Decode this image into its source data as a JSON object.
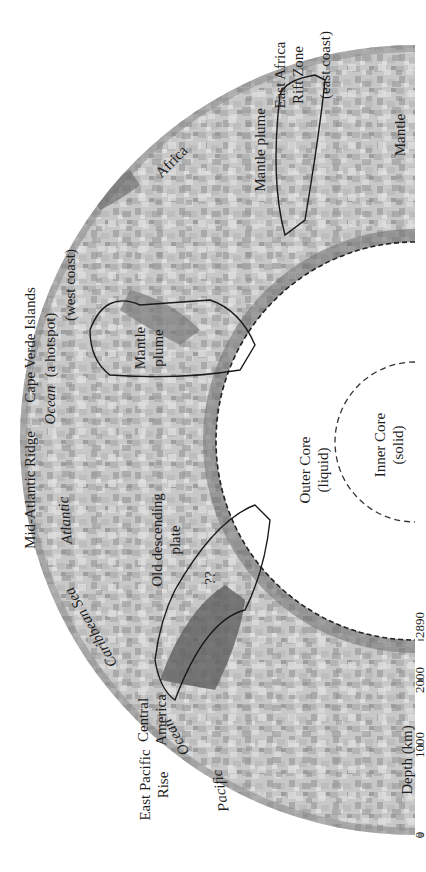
{
  "figure": {
    "type": "seismic tomography cross-section",
    "orientation": "rotated 90 degrees counter-clockwise",
    "regions": {
      "outer_core": {
        "label": "Outer Core",
        "sub": "(liquid)"
      },
      "inner_core": {
        "label": "Inner Core",
        "sub": "(solid)"
      },
      "mantle": {
        "label": "Mantle"
      }
    },
    "annotations": {
      "old_plate": {
        "line1": "Old descending",
        "line2": "plate",
        "question": "??"
      },
      "plume_atlantic": {
        "line1": "Mantle",
        "line2": "plume"
      },
      "plume_africa": {
        "label": "Mantle plume"
      }
    },
    "surface_labels": {
      "east_pacific": {
        "line1": "East Pacific",
        "line2": "Rise"
      },
      "pacific": "Pacific",
      "ocean_pacific": "Ocean",
      "central_america": {
        "line1": "Central",
        "line2": "America"
      },
      "caribbean": "Caribbean Sea",
      "atlantic": "Atlantic",
      "mid_atlantic": "Mid-Atlantic Ridge",
      "ocean_atlantic": "Ocean",
      "cape_verde": {
        "line1": "Cape Verde Islands",
        "line2": "(a hotspot)"
      },
      "west_coast": "(west coast)",
      "africa": "Africa",
      "east_africa": {
        "line1": "East Africa",
        "line2": "Rift Zone"
      },
      "east_coast": "(east coast)"
    },
    "depth_axis": {
      "title": "Depth (km)",
      "ticks": [
        "0",
        "1000",
        "2000",
        "2890"
      ]
    },
    "colors": {
      "fast_dark": "#6a6a6a",
      "mid": "#a8a8a8",
      "slow_light": "#d4d4d4",
      "outline": "#1a1a1a"
    },
    "caption_fragment": "..."
  }
}
